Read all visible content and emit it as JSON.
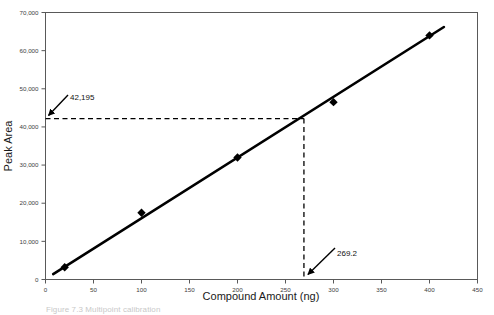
{
  "figure": {
    "caption": "Figure 7.3  Multipoint calibration"
  },
  "chart_data": {
    "type": "scatter",
    "title": "",
    "xlabel": "Compound Amount (ng)",
    "ylabel": "Peak Area",
    "xlim": [
      0,
      450
    ],
    "ylim": [
      0,
      70000
    ],
    "xticks": [
      0,
      50,
      100,
      150,
      200,
      250,
      300,
      350,
      400,
      450
    ],
    "xtick_labels": [
      "0",
      "50",
      "100",
      "150",
      "200",
      "250",
      "300",
      "350",
      "400",
      "450"
    ],
    "yticks": [
      0,
      10000,
      20000,
      30000,
      40000,
      50000,
      60000,
      70000
    ],
    "ytick_labels": [
      "0",
      "10,000",
      "20,000",
      "30,000",
      "40,000",
      "50,000",
      "60,000",
      "70,000"
    ],
    "grid": false,
    "legend": false,
    "marker": "diamond",
    "marker_color": "#000000",
    "line_color": "#000000",
    "series": [
      {
        "name": "Calibration points",
        "x": [
          20,
          100,
          200,
          300,
          400
        ],
        "y": [
          3200,
          17500,
          32000,
          46500,
          64000
        ]
      }
    ],
    "fit_line": {
      "name": "Calibration curve",
      "x": [
        8,
        415
      ],
      "y": [
        1400,
        66200
      ]
    },
    "annotations": [
      {
        "name": "peak-area-readout",
        "label": "42,195",
        "value": 42195,
        "axis": "y",
        "guide": "horizontal-dashed",
        "guide_from_x": 0,
        "guide_to_x": 269.2
      },
      {
        "name": "compound-amount-readout",
        "label": "269.2",
        "value": 269.2,
        "axis": "x",
        "guide": "vertical-dashed",
        "guide_from_y": 0,
        "guide_to_y": 42195
      }
    ]
  }
}
